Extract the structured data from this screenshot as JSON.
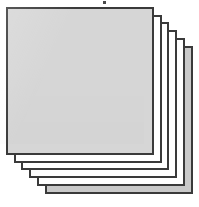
{
  "figure": {
    "canvas": {
      "width": 199,
      "height": 207,
      "background_color": "#ffffff"
    },
    "style": {
      "front_fill_color": "#d6d6d6",
      "back_fill_color": "#ffffff",
      "last_sheet_fill_color": "#c9c9c9",
      "border_color": "#3a3a3a",
      "border_width_px": 2,
      "sheet_count": 6,
      "offset_x_px": 9,
      "offset_y_px": 9,
      "sheet_size_px": 148
    },
    "sheets": [
      {
        "index": 5,
        "name": "sheet-back-5",
        "left": 45,
        "top": 46,
        "size": 148,
        "fill": "#c9c9c9",
        "z": 1
      },
      {
        "index": 4,
        "name": "sheet-back-4",
        "left": 37,
        "top": 38,
        "size": 148,
        "fill": "#ffffff",
        "z": 2
      },
      {
        "index": 3,
        "name": "sheet-back-3",
        "left": 29,
        "top": 30,
        "size": 148,
        "fill": "#ffffff",
        "z": 3
      },
      {
        "index": 2,
        "name": "sheet-back-2",
        "left": 21,
        "top": 22,
        "size": 148,
        "fill": "#ffffff",
        "z": 4
      },
      {
        "index": 1,
        "name": "sheet-back-1",
        "left": 14,
        "top": 15,
        "size": 148,
        "fill": "#ffffff",
        "z": 5
      },
      {
        "index": 0,
        "name": "sheet-front",
        "left": 6,
        "top": 7,
        "size": 148,
        "fill": "#d6d6d6",
        "z": 6
      }
    ],
    "artifacts": [
      {
        "name": "scan-speck",
        "left": 103,
        "top": 1,
        "width": 3,
        "height": 3,
        "color": "#4a4a4a"
      }
    ]
  }
}
